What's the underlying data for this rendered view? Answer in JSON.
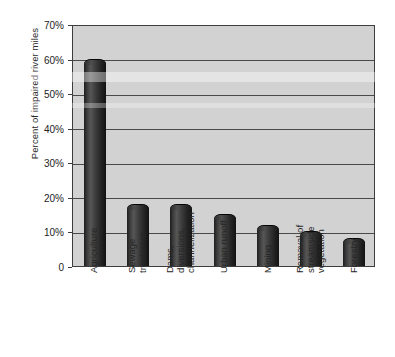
{
  "chart_data": {
    "type": "bar",
    "title": "",
    "xlabel": "",
    "ylabel": "Percent of impaired river miles",
    "categories": [
      "Agriculture",
      "Sewage treatment",
      "Dams, diversions, channelization",
      "Urban runoff",
      "Mining",
      "Removal of streamside vegetation",
      "Forestry"
    ],
    "category_lines": [
      [
        "Agriculture"
      ],
      [
        "Sewage",
        "treatment"
      ],
      [
        "Dams,",
        "diversions,",
        "channelization"
      ],
      [
        "Urban runoff"
      ],
      [
        "Mining"
      ],
      [
        "Removal of",
        "streamside",
        "vegetation"
      ],
      [
        "Forestry"
      ]
    ],
    "values": [
      60,
      18,
      18,
      15,
      12,
      10,
      8
    ],
    "ylim": [
      0,
      70
    ],
    "ytick_values": [
      70,
      60,
      50,
      40,
      30,
      20,
      10,
      0
    ],
    "ytick_labels": [
      "70%",
      "60%",
      "50%",
      "40%",
      "30%",
      "20%",
      "10%",
      "0"
    ],
    "grid": true,
    "legend": "none",
    "bar_color": "#2a2a2a",
    "plot_background": "#d2d2d2",
    "axis_color": "#3d3d3d"
  }
}
